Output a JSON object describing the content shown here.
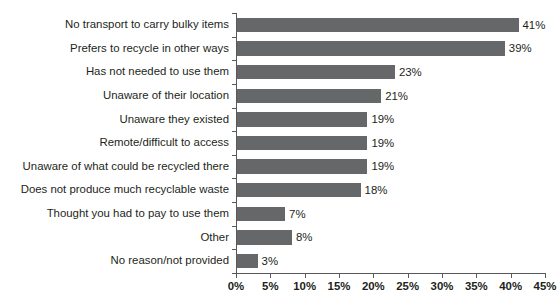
{
  "chart_data": {
    "type": "bar",
    "orientation": "horizontal",
    "title": "",
    "xlabel": "",
    "ylabel": "",
    "xlim": [
      0,
      45
    ],
    "xtick_labels": [
      "0%",
      "5%",
      "10%",
      "15%",
      "20%",
      "25%",
      "30%",
      "35%",
      "40%",
      "45%"
    ],
    "xtick_values": [
      0,
      5,
      10,
      15,
      20,
      25,
      30,
      35,
      40,
      45
    ],
    "grid": false,
    "legend": false,
    "bar_color": "#666769",
    "axis_color": "#58595b",
    "text_color": "#231f20",
    "categories": [
      "No transport to carry bulky items",
      "Prefers to recycle in other ways",
      "Has not needed to use them",
      "Unaware of their location",
      "Unaware they existed",
      "Remote/difficult to access",
      "Unaware of what could be recycled there",
      "Does not produce much recyclable waste",
      "Thought you had to pay to use them",
      "Other",
      "No reason/not provided"
    ],
    "values": [
      41,
      39,
      23,
      21,
      19,
      19,
      19,
      18,
      7,
      8,
      3
    ],
    "value_labels": [
      "41%",
      "39%",
      "23%",
      "21%",
      "19%",
      "19%",
      "19%",
      "18%",
      "7%",
      "8%",
      "3%"
    ]
  }
}
